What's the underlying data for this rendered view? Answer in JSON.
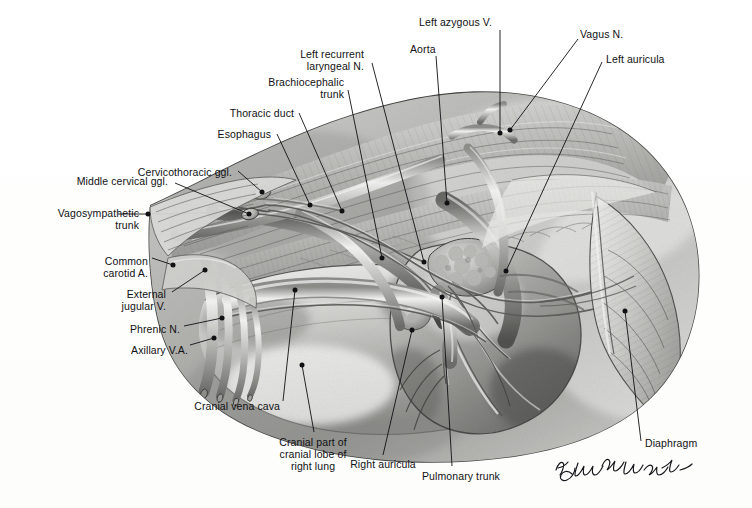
{
  "figure": {
    "domain": "anatomical-illustration",
    "medium": "graphite pencil drawing",
    "background_color": "#ffffff",
    "ink_color": "#111113",
    "signature": "M. Constantinescu"
  },
  "labels": [
    {
      "id": "left-azygous-vein",
      "text": "Left azygous V.",
      "align": "left",
      "x": 419,
      "y": 16,
      "w": 100,
      "line": [
        [
          500,
          30
        ],
        [
          500,
          133
        ]
      ],
      "dot": [
        500,
        133
      ]
    },
    {
      "id": "vagus-nerve",
      "text": "Vagus N.",
      "align": "left",
      "x": 580,
      "y": 28,
      "w": 70,
      "line": [
        [
          578,
          39
        ],
        [
          510,
          130
        ]
      ],
      "dot": [
        510,
        130
      ]
    },
    {
      "id": "aorta",
      "text": "Aorta",
      "align": "left",
      "x": 410,
      "y": 43,
      "w": 50,
      "line": [
        [
          436,
          56
        ],
        [
          447,
          203
        ]
      ],
      "dot": [
        447,
        203
      ]
    },
    {
      "id": "left-auricula",
      "text": "Left auricula",
      "align": "left",
      "x": 606,
      "y": 53,
      "w": 80,
      "line": [
        [
          602,
          62
        ],
        [
          506,
          271
        ]
      ],
      "dot": [
        506,
        271
      ]
    },
    {
      "id": "left-recurrent-laryngeal-nrv",
      "text": "Left recurrent\nlaryngeal N.",
      "align": "right",
      "x": 240,
      "y": 48,
      "w": 124,
      "line": [
        [
          372,
          63
        ],
        [
          424,
          262
        ]
      ],
      "dot": [
        424,
        262
      ]
    },
    {
      "id": "brachiocephalic-trunk",
      "text": "Brachiocephalic\ntrunk",
      "align": "right",
      "x": 230,
      "y": 76,
      "w": 114,
      "line": [
        [
          348,
          90
        ],
        [
          382,
          258
        ]
      ],
      "dot": [
        382,
        258
      ]
    },
    {
      "id": "thoracic-duct",
      "text": "Thoracic duct",
      "align": "right",
      "x": 206,
      "y": 107,
      "w": 88,
      "line": [
        [
          299,
          113
        ],
        [
          342,
          211
        ]
      ],
      "dot": [
        342,
        211
      ]
    },
    {
      "id": "esophagus",
      "text": "Esophagus",
      "align": "right",
      "x": 199,
      "y": 128,
      "w": 72,
      "line": [
        [
          277,
          134
        ],
        [
          310,
          205
        ]
      ],
      "dot": [
        310,
        205
      ]
    },
    {
      "id": "cervicothoracic-ggl",
      "text": "Cervicothoracic ggl.",
      "align": "right",
      "x": 108,
      "y": 166,
      "w": 124,
      "line": [
        [
          238,
          171
        ],
        [
          262,
          192
        ]
      ],
      "dot": [
        262,
        192
      ]
    },
    {
      "id": "middle-cervical-ggl",
      "text": "Middle cervical ggl.",
      "align": "right",
      "x": 40,
      "y": 175,
      "w": 128,
      "line": [
        [
          175,
          183
        ],
        [
          249,
          214
        ]
      ],
      "dot": [
        249,
        214
      ]
    },
    {
      "id": "vagosympathetic-trunk",
      "text": "Vagosympathetic\ntrunk",
      "align": "right",
      "x": 27,
      "y": 207,
      "w": 112,
      "line": [
        [
          118,
          214
        ],
        [
          148,
          214
        ]
      ],
      "dot": [
        148,
        214
      ]
    },
    {
      "id": "common-carotid-artery",
      "text": "Common\ncarotid A.",
      "align": "right",
      "x": 70,
      "y": 255,
      "w": 78,
      "line": [
        [
          152,
          258
        ],
        [
          173,
          265
        ]
      ],
      "dot": [
        173,
        265
      ]
    },
    {
      "id": "external-jugular-vein",
      "text": "External\njugular V.",
      "align": "right",
      "x": 88,
      "y": 288,
      "w": 78,
      "line": [
        [
          172,
          292
        ],
        [
          205,
          270
        ]
      ],
      "dot": [
        205,
        270
      ]
    },
    {
      "id": "phrenic-nerve",
      "text": "Phrenic N.",
      "align": "right",
      "x": 110,
      "y": 323,
      "w": 70,
      "line": [
        [
          184,
          326
        ],
        [
          222,
          318
        ]
      ],
      "dot": [
        222,
        318
      ]
    },
    {
      "id": "axillary-vein-artery",
      "text": "Axillary V.A.",
      "align": "right",
      "x": 110,
      "y": 344,
      "w": 78,
      "line": [
        [
          190,
          345
        ],
        [
          214,
          338
        ]
      ],
      "dot": [
        214,
        338
      ]
    },
    {
      "id": "cranial-vena-cava",
      "text": "Cranial vena cava",
      "align": "right",
      "x": 168,
      "y": 400,
      "w": 112,
      "line": [
        [
          283,
          401
        ],
        [
          295,
          290
        ]
      ],
      "dot": [
        295,
        290
      ]
    },
    {
      "id": "cranial-part-cranial-lobe-right-lung",
      "text": "Cranial part of\ncranial lobe of\nright lung",
      "align": "center",
      "x": 258,
      "y": 436,
      "w": 110,
      "line": [
        [
          314,
          432
        ],
        [
          302,
          365
        ]
      ],
      "dot": [
        302,
        365
      ]
    },
    {
      "id": "right-auricula",
      "text": "Right auricula",
      "align": "center",
      "x": 338,
      "y": 458,
      "w": 90,
      "line": [
        [
          383,
          455
        ],
        [
          412,
          330
        ]
      ],
      "dot": [
        412,
        330
      ]
    },
    {
      "id": "pulmonary-trunk",
      "text": "Pulmonary trunk",
      "align": "center",
      "x": 408,
      "y": 470,
      "w": 106,
      "line": [
        [
          452,
          466
        ],
        [
          442,
          297
        ]
      ],
      "dot": [
        442,
        297
      ]
    },
    {
      "id": "diaphragm",
      "text": "Diaphragm",
      "align": "left",
      "x": 645,
      "y": 437,
      "w": 72,
      "line": [
        [
          641,
          441
        ],
        [
          625,
          311
        ]
      ],
      "dot": [
        625,
        311
      ]
    }
  ]
}
